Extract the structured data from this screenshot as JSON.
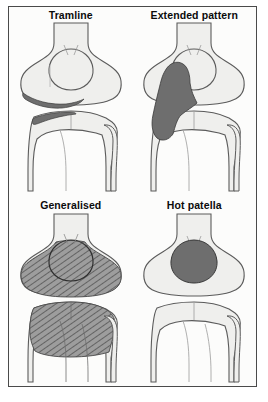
{
  "figure": {
    "border_color": "#4a4a4a",
    "background_color": "#fcfcfb",
    "bone_fill": "#efefed",
    "bone_outline": "#5b5b5b",
    "solid_uptake_color": "#6e6e6e",
    "hatch_uptake_color": "#9a9a9a",
    "hatch_line_color": "#4f4f4f",
    "label_color": "#0b0b0b"
  },
  "panels": [
    {
      "id": "tramline",
      "label": "Tramline",
      "uptake_style": "solid",
      "description": "Thin linear bands of increased uptake along the medial femoral and tibial joint margins"
    },
    {
      "id": "extended-pattern",
      "label": "Extended pattern",
      "uptake_style": "solid",
      "description": "Large confluent area of increased uptake spanning the medial femoral condyle and tibial plateau"
    },
    {
      "id": "generalised",
      "label": "Generalised",
      "uptake_style": "hatched",
      "description": "Diffuse increased uptake across the whole distal femur and proximal tibia"
    },
    {
      "id": "hot-patella",
      "label": "Hot patella",
      "uptake_style": "solid",
      "description": "Focal rounded area of increased uptake confined to the patella"
    }
  ]
}
